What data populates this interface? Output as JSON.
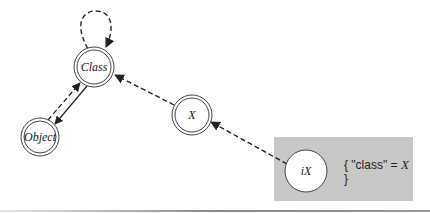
{
  "diagram": {
    "nodes": [
      {
        "id": "class",
        "label": "Class",
        "style": "double-circle"
      },
      {
        "id": "object",
        "label": "Object",
        "style": "double-circle"
      },
      {
        "id": "x",
        "label": "X",
        "style": "double-circle"
      },
      {
        "id": "ix",
        "label": "iX",
        "style": "single-circle"
      }
    ],
    "edges": [
      {
        "from": "class",
        "to": "class",
        "style": "dashed",
        "kind": "self-loop"
      },
      {
        "from": "object",
        "to": "class",
        "style": "dashed"
      },
      {
        "from": "class",
        "to": "object",
        "style": "solid"
      },
      {
        "from": "x",
        "to": "class",
        "style": "dashed"
      },
      {
        "from": "ix",
        "to": "x",
        "style": "dashed"
      }
    ],
    "instance_box": {
      "line1_prefix": "{ \"class\" = ",
      "line1_value": "X",
      "line2": "}",
      "fill_color": "#c8c8c8"
    }
  }
}
